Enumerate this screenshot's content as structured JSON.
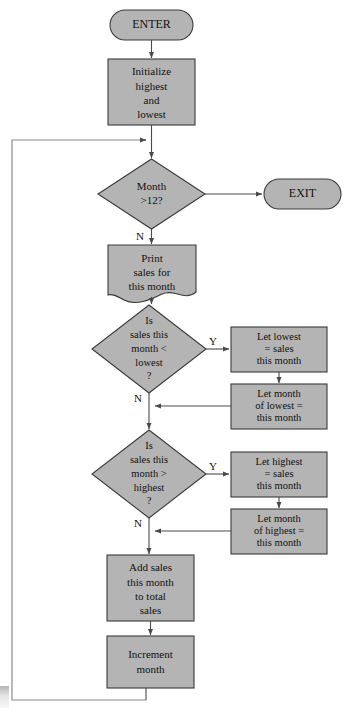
{
  "diagram": {
    "colors": {
      "shape_fill": "#b4b4b4",
      "shape_stroke": "#3a3a3a",
      "connector": "#4a4a4a",
      "loop_line": "#8a8a8a",
      "text": "#111111",
      "background": "#ffffff"
    },
    "nodes": {
      "enter": {
        "type": "terminal",
        "label": "ENTER"
      },
      "exit": {
        "type": "terminal",
        "label": "EXIT"
      },
      "initialize": {
        "type": "process",
        "lines": [
          "Initialize",
          "highest",
          "and",
          "lowest"
        ]
      },
      "month_check": {
        "type": "decision",
        "lines": [
          "Month",
          ">12?"
        ],
        "yes_label": "",
        "no_label": "N"
      },
      "print_sales": {
        "type": "document",
        "lines": [
          "Print",
          "sales for",
          "this month"
        ]
      },
      "lowest_check": {
        "type": "decision",
        "lines": [
          "Is",
          "sales this",
          "month <",
          "lowest",
          "?"
        ],
        "yes_label": "Y",
        "no_label": "N"
      },
      "set_lowest": {
        "type": "process",
        "lines": [
          "Let lowest",
          "= sales",
          "this month"
        ]
      },
      "set_month_of_lowest": {
        "type": "process",
        "lines": [
          "Let month",
          "of  lowest =",
          "this month"
        ]
      },
      "highest_check": {
        "type": "decision",
        "lines": [
          "Is",
          "sales this",
          "month >",
          "highest",
          "?"
        ],
        "yes_label": "Y",
        "no_label": "N"
      },
      "set_highest": {
        "type": "process",
        "lines": [
          "Let highest",
          "= sales",
          "this month"
        ]
      },
      "set_month_of_highest": {
        "type": "process",
        "lines": [
          "Let month",
          "of highest =",
          "this month"
        ]
      },
      "add_sales": {
        "type": "process",
        "lines": [
          "Add sales",
          "this month",
          "to total",
          "sales"
        ]
      },
      "increment_month": {
        "type": "process",
        "lines": [
          "Increment",
          "month"
        ]
      }
    }
  }
}
